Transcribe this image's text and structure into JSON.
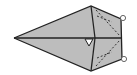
{
  "diagram": {
    "type": "geometric-figure",
    "fill": "#bdbdbd",
    "stroke": "#222222",
    "background": "#ffffff",
    "points": {
      "left_tip": [
        14,
        38
      ],
      "top": [
        91,
        6
      ],
      "bottom": [
        91,
        71
      ],
      "center": [
        95,
        38
      ],
      "right_top": [
        121,
        19
      ],
      "right_mid": [
        122,
        38
      ],
      "right_bottom": [
        122,
        59
      ]
    },
    "markers": {
      "right_angle_triangle": [
        [
          85,
          39
        ],
        [
          93,
          39
        ],
        [
          89,
          46
        ]
      ],
      "circles": [
        [
          123,
          18
        ],
        [
          124,
          59
        ]
      ]
    }
  }
}
